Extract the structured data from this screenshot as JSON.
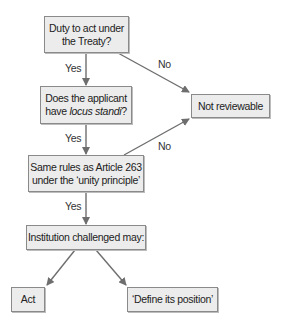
{
  "nodes": {
    "duty": {
      "line1": "Duty to act under",
      "line2": "the Treaty?"
    },
    "standing": {
      "line1": "Does the applicant",
      "line2_prefix": "have ",
      "line2_italic": "locus standi",
      "line2_suffix": "?"
    },
    "rules": {
      "line1": "Same rules as Article 263",
      "line2": "under the ‘unity principle’"
    },
    "institution": {
      "label": "Institution challenged may:"
    },
    "not_reviewable": {
      "label": "Not reviewable"
    },
    "act": {
      "label": "Act"
    },
    "define": {
      "label": "‘Define its position’"
    }
  },
  "edges": {
    "duty_yes": "Yes",
    "duty_no": "No",
    "standing_yes": "Yes",
    "rules_no": "No",
    "rules_yes": "Yes"
  },
  "colors": {
    "box_fill": "#ececec",
    "box_border": "#8a8a8a",
    "arrow": "#6e6e6e"
  }
}
